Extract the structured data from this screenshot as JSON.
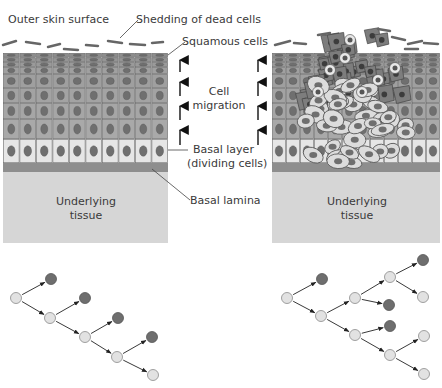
{
  "labels": {
    "outer_skin_surface": "Outer skin surface",
    "shedding": "Shedding of dead cells",
    "squamous": "Squamous cells",
    "cell_migration_1": "Cell",
    "cell_migration_2": "migration",
    "basal_layer_1": "Basal layer",
    "basal_layer_2": "(dividing cells)",
    "basal_lamina": "Basal lamina",
    "underlying_left_1": "Underlying",
    "underlying_left_2": "tissue",
    "underlying_right_1": "Underlying",
    "underlying_right_2": "tissue"
  },
  "colors": {
    "tissue": "#d6d6d6",
    "lamina": "#8e8e8e",
    "suprabasal_cell": "#9d9d9d",
    "basal_cell": "#e6e6e6",
    "nucleus": "#6f6f6f",
    "tumor_dark_cell": "#7d7d7d",
    "tumor_light_cell": "#dcdcdc",
    "lineage_stem": "#e2e2e2",
    "lineage_differentiated": "#6e6e6e"
  },
  "lineage_left": {
    "nodes": [
      {
        "id": "s0",
        "x": 16,
        "y": 298,
        "type": "stem"
      },
      {
        "id": "d1",
        "x": 51,
        "y": 279,
        "type": "differentiated"
      },
      {
        "id": "s1",
        "x": 50,
        "y": 318,
        "type": "stem"
      },
      {
        "id": "d2",
        "x": 85,
        "y": 298,
        "type": "differentiated"
      },
      {
        "id": "s2",
        "x": 85,
        "y": 337,
        "type": "stem"
      },
      {
        "id": "d3",
        "x": 118,
        "y": 318,
        "type": "differentiated"
      },
      {
        "id": "s3",
        "x": 117,
        "y": 357,
        "type": "stem"
      },
      {
        "id": "d4",
        "x": 152,
        "y": 337,
        "type": "differentiated"
      },
      {
        "id": "s4",
        "x": 153,
        "y": 375,
        "type": "stem"
      }
    ],
    "edges": [
      [
        "s0",
        "d1"
      ],
      [
        "s0",
        "s1"
      ],
      [
        "s1",
        "d2"
      ],
      [
        "s1",
        "s2"
      ],
      [
        "s2",
        "d3"
      ],
      [
        "s2",
        "s3"
      ],
      [
        "s3",
        "d4"
      ],
      [
        "s3",
        "s4"
      ]
    ]
  },
  "lineage_right": {
    "nodes": [
      {
        "id": "r0",
        "x": 287,
        "y": 298,
        "type": "stem"
      },
      {
        "id": "r1",
        "x": 322,
        "y": 279,
        "type": "differentiated"
      },
      {
        "id": "r2",
        "x": 321,
        "y": 316,
        "type": "stem"
      },
      {
        "id": "r3",
        "x": 355,
        "y": 298,
        "type": "stem"
      },
      {
        "id": "r4",
        "x": 355,
        "y": 335,
        "type": "stem"
      },
      {
        "id": "r5",
        "x": 390,
        "y": 277,
        "type": "stem"
      },
      {
        "id": "r6",
        "x": 389,
        "y": 305,
        "type": "differentiated"
      },
      {
        "id": "r7",
        "x": 423,
        "y": 260,
        "type": "differentiated"
      },
      {
        "id": "r8",
        "x": 423,
        "y": 297,
        "type": "stem"
      },
      {
        "id": "r9",
        "x": 390,
        "y": 326,
        "type": "differentiated"
      },
      {
        "id": "r10",
        "x": 390,
        "y": 355,
        "type": "stem"
      },
      {
        "id": "r11",
        "x": 424,
        "y": 336,
        "type": "stem"
      },
      {
        "id": "r12",
        "x": 424,
        "y": 374,
        "type": "stem"
      }
    ],
    "edges": [
      [
        "r0",
        "r1"
      ],
      [
        "r0",
        "r2"
      ],
      [
        "r2",
        "r3"
      ],
      [
        "r2",
        "r4"
      ],
      [
        "r3",
        "r5"
      ],
      [
        "r3",
        "r6"
      ],
      [
        "r5",
        "r7"
      ],
      [
        "r5",
        "r8"
      ],
      [
        "r4",
        "r9"
      ],
      [
        "r4",
        "r10"
      ],
      [
        "r10",
        "r11"
      ],
      [
        "r10",
        "r12"
      ]
    ]
  }
}
